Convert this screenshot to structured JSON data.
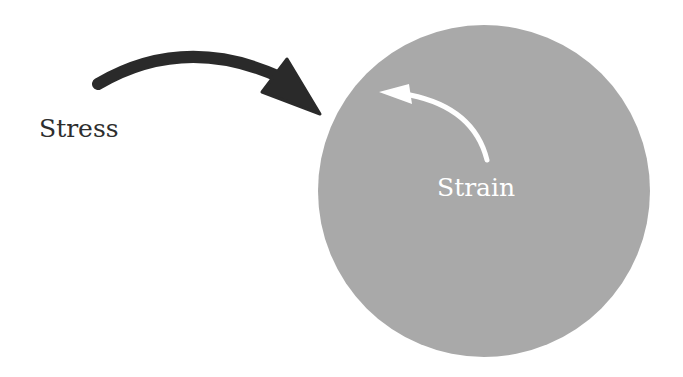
{
  "diagram": {
    "labels": {
      "stress": "Stress",
      "strain": "Strain"
    },
    "shapes": {
      "body_circle": {
        "cx": 484,
        "cy": 191,
        "r": 166,
        "fill": "#a9a9a9"
      },
      "stress_arrow": {
        "color": "#2a2a2a",
        "direction": "clockwise, pointing toward circle"
      },
      "strain_arrow": {
        "color": "#ffffff",
        "direction": "counter-clockwise, inside circle"
      }
    }
  }
}
